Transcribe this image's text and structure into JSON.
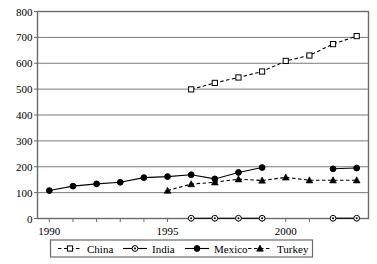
{
  "chart_data": {
    "type": "line",
    "title": "",
    "xlabel": "",
    "ylabel": "",
    "xlim": [
      1990,
      2003
    ],
    "ylim": [
      0,
      800
    ],
    "ytick_labels": [
      "0",
      "100",
      "200",
      "300",
      "400",
      "500",
      "600",
      "700",
      "800"
    ],
    "ytick_values": [
      0,
      100,
      200,
      300,
      400,
      500,
      600,
      700,
      800
    ],
    "xtick_labels": [
      "1990",
      "1995",
      "2000"
    ],
    "xtick_values": [
      1990,
      1995,
      2000
    ],
    "grid": "horizontal",
    "legend_position": "bottom",
    "x": [
      1990,
      1991,
      1992,
      1993,
      1994,
      1995,
      1996,
      1997,
      1998,
      1999,
      2000,
      2001,
      2002,
      2003
    ],
    "series": [
      {
        "name": "China",
        "marker": "open-square",
        "line": "dashed",
        "values": [
          null,
          null,
          null,
          null,
          null,
          null,
          499,
          524,
          545,
          568,
          609,
          630,
          674,
          705
        ]
      },
      {
        "name": "India",
        "marker": "open-circle-dot",
        "line": "solid",
        "values": [
          null,
          null,
          null,
          null,
          null,
          null,
          1,
          1,
          1,
          1,
          null,
          null,
          1,
          1
        ]
      },
      {
        "name": "Mexico",
        "marker": "filled-circle",
        "line": "solid",
        "values": [
          108,
          125,
          134,
          140,
          158,
          162,
          169,
          153,
          178,
          197,
          null,
          null,
          192,
          195
        ]
      },
      {
        "name": "Turkey",
        "marker": "filled-triangle",
        "line": "dashed",
        "values": [
          null,
          null,
          null,
          null,
          null,
          108,
          133,
          140,
          152,
          147,
          159,
          148,
          148,
          148
        ]
      }
    ]
  },
  "legend": {
    "items": [
      {
        "label": "China"
      },
      {
        "label": "India"
      },
      {
        "label": "Mexico"
      },
      {
        "label": "Turkey"
      }
    ]
  },
  "colors": {
    "axis": "#6b6b6b",
    "grid": "#7a7a7a",
    "series": "#000000",
    "background": "#ffffff"
  }
}
